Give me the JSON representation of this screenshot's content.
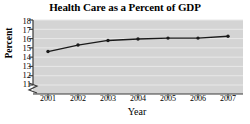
{
  "chart_data": {
    "type": "line",
    "title": "Health Care as a Percent of GDP",
    "xlabel": "Year",
    "ylabel": "Percent",
    "categories": [
      "2001",
      "2002",
      "2003",
      "2004",
      "2005",
      "2006",
      "2007"
    ],
    "x": [
      2001,
      2002,
      2003,
      2004,
      2005,
      2006,
      2007
    ],
    "values": [
      14.6,
      15.3,
      15.8,
      15.95,
      16.05,
      16.05,
      16.25
    ],
    "series": [
      {
        "name": "Health Care as a Percent of GDP",
        "values": [
          14.6,
          15.3,
          15.8,
          15.95,
          16.05,
          16.05,
          16.25
        ]
      }
    ],
    "ylim": [
      11,
      18
    ],
    "y_ticks": [
      11,
      12,
      13,
      14,
      15,
      16,
      17,
      18
    ],
    "y_tick_labels": [
      "11",
      "12",
      "13",
      "14",
      "15",
      "16",
      "17",
      "18"
    ],
    "xlim": [
      2000.5,
      2007.5
    ],
    "grid": true,
    "grid_axis": "y",
    "legend": false,
    "legend_position": "none",
    "axis_break": true,
    "axis_break_note": "zigzag break on y-axis below 11",
    "marker": "circle",
    "colors": {
      "line": "#1a1a1a",
      "marker": "#1a1a1a",
      "plot_background": "#d4d4d4",
      "gridline": "#e8e8e8",
      "axis": "#3a3a3a",
      "page_background": "#ffffff",
      "text": "#000000"
    }
  }
}
